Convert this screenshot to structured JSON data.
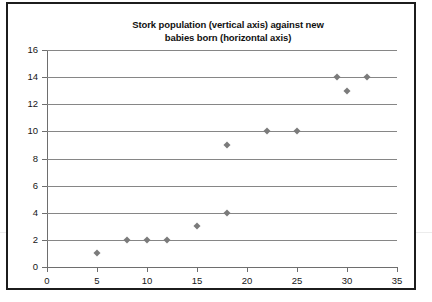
{
  "chart_data": {
    "type": "scatter",
    "title": "Stork population (vertical axis) against new babies born (horizontal axis)",
    "title_line1": "Stork population (vertical axis) against new",
    "title_line2": "babies born (horizontal axis)",
    "xlabel": "",
    "ylabel": "",
    "xlim": [
      0,
      35
    ],
    "ylim": [
      0,
      16
    ],
    "xticks": [
      0,
      5,
      10,
      15,
      20,
      25,
      30,
      35
    ],
    "yticks": [
      0,
      2,
      4,
      6,
      8,
      10,
      12,
      14,
      16
    ],
    "grid": "horizontal",
    "legend": "none",
    "marker": "diamond",
    "marker_color": "#7b7b7b",
    "gridline_color": "#868686",
    "axis_color": "#6e6e6e",
    "frame_color": "#1c1c1c",
    "points": [
      {
        "x": 5,
        "y": 1
      },
      {
        "x": 8,
        "y": 2
      },
      {
        "x": 10,
        "y": 2
      },
      {
        "x": 12,
        "y": 2
      },
      {
        "x": 15,
        "y": 3
      },
      {
        "x": 18,
        "y": 4
      },
      {
        "x": 18,
        "y": 9
      },
      {
        "x": 22,
        "y": 10
      },
      {
        "x": 25,
        "y": 10
      },
      {
        "x": 29,
        "y": 14
      },
      {
        "x": 30,
        "y": 13
      },
      {
        "x": 32,
        "y": 14
      }
    ]
  }
}
